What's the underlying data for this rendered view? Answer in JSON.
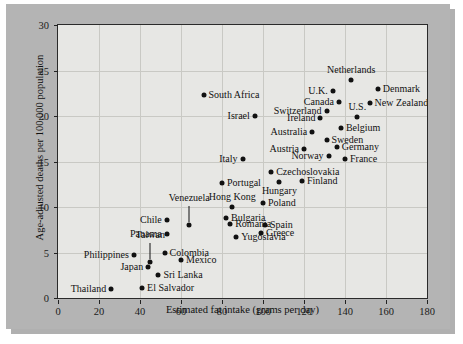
{
  "figure": {
    "background_color": "#ffffff",
    "mount_color": "#b4b4b4",
    "panel_color": "#e7e7e4",
    "axis_color": "#222222",
    "grid_color": "#c9c9c4",
    "point_color": "#111111"
  },
  "chart_data": {
    "type": "scatter",
    "title": "",
    "xlabel": "Estimated fat intake (grams per day)",
    "ylabel": "Age-adjusted deaths per 100,000 population",
    "xlim": [
      0,
      180
    ],
    "ylim": [
      0,
      30
    ],
    "xticks": [
      0,
      20,
      40,
      60,
      80,
      100,
      120,
      140,
      160,
      180
    ],
    "yticks": [
      0,
      5,
      10,
      15,
      20,
      25,
      30
    ],
    "grid": true,
    "legend": "none",
    "points": [
      {
        "label": "South Africa",
        "x": 71,
        "y": 22.3,
        "label_pos": "right",
        "leader": false
      },
      {
        "label": "Israel",
        "x": 96,
        "y": 20.0,
        "label_pos": "left",
        "leader": false
      },
      {
        "label": "Netherlands",
        "x": 143,
        "y": 24.0,
        "label_pos": "above",
        "leader": false
      },
      {
        "label": "Denmark",
        "x": 156,
        "y": 23.0,
        "label_pos": "right",
        "leader": false
      },
      {
        "label": "U.K.",
        "x": 134,
        "y": 22.8,
        "label_pos": "left",
        "leader": false
      },
      {
        "label": "Canada",
        "x": 137,
        "y": 21.5,
        "label_pos": "left",
        "leader": false
      },
      {
        "label": "New Zealand",
        "x": 152,
        "y": 21.4,
        "label_pos": "right",
        "leader": false
      },
      {
        "label": "Switzerland",
        "x": 131,
        "y": 20.6,
        "label_pos": "left",
        "leader": false
      },
      {
        "label": "U.S.",
        "x": 146,
        "y": 19.9,
        "label_pos": "above",
        "leader": false
      },
      {
        "label": "Ireland",
        "x": 128,
        "y": 19.8,
        "label_pos": "left",
        "leader": false
      },
      {
        "label": "Belgium",
        "x": 138,
        "y": 18.7,
        "label_pos": "right",
        "leader": false
      },
      {
        "label": "Australia",
        "x": 124,
        "y": 18.2,
        "label_pos": "left",
        "leader": false
      },
      {
        "label": "Sweden",
        "x": 131,
        "y": 17.4,
        "label_pos": "right",
        "leader": false
      },
      {
        "label": "Germany",
        "x": 136,
        "y": 16.6,
        "label_pos": "right",
        "leader": false
      },
      {
        "label": "Austria",
        "x": 120,
        "y": 16.4,
        "label_pos": "left",
        "leader": false
      },
      {
        "label": "Norway",
        "x": 132,
        "y": 15.6,
        "label_pos": "left",
        "leader": false
      },
      {
        "label": "France",
        "x": 140,
        "y": 15.3,
        "label_pos": "right",
        "leader": false
      },
      {
        "label": "Italy",
        "x": 90,
        "y": 15.3,
        "label_pos": "left",
        "leader": false
      },
      {
        "label": "Czechoslovakia",
        "x": 104,
        "y": 13.8,
        "label_pos": "right",
        "leader": false
      },
      {
        "label": "Finland",
        "x": 119,
        "y": 12.9,
        "label_pos": "right",
        "leader": false
      },
      {
        "label": "Hungary",
        "x": 108,
        "y": 12.8,
        "label_pos": "below",
        "leader": false
      },
      {
        "label": "Portugal",
        "x": 80,
        "y": 12.6,
        "label_pos": "right",
        "leader": false
      },
      {
        "label": "Poland",
        "x": 100,
        "y": 10.4,
        "label_pos": "right",
        "leader": false
      },
      {
        "label": "Hong Kong",
        "x": 85,
        "y": 10.0,
        "label_pos": "above",
        "leader": false
      },
      {
        "label": "Venezuela",
        "x": 64,
        "y": 8.0,
        "label_pos": "above",
        "leader": true
      },
      {
        "label": "Bulgaria",
        "x": 82,
        "y": 8.8,
        "label_pos": "right",
        "leader": false
      },
      {
        "label": "Chile",
        "x": 53,
        "y": 8.6,
        "label_pos": "left",
        "leader": false
      },
      {
        "label": "Romania",
        "x": 84,
        "y": 8.1,
        "label_pos": "right",
        "leader": false
      },
      {
        "label": "Spain",
        "x": 101,
        "y": 8.0,
        "label_pos": "right",
        "leader": false
      },
      {
        "label": "Greece",
        "x": 99,
        "y": 7.1,
        "label_pos": "right",
        "leader": false
      },
      {
        "label": "Panama",
        "x": 53,
        "y": 7.0,
        "label_pos": "left",
        "leader": false
      },
      {
        "label": "Yugoslavia",
        "x": 87,
        "y": 6.7,
        "label_pos": "right",
        "leader": false
      },
      {
        "label": "Taiwan",
        "x": 45,
        "y": 4.0,
        "label_pos": "above",
        "leader": true
      },
      {
        "label": "Colombia",
        "x": 52,
        "y": 4.9,
        "label_pos": "right",
        "leader": false
      },
      {
        "label": "Philippines",
        "x": 37,
        "y": 4.7,
        "label_pos": "left",
        "leader": false
      },
      {
        "label": "Mexico",
        "x": 60,
        "y": 4.2,
        "label_pos": "right",
        "leader": false
      },
      {
        "label": "Japan",
        "x": 44,
        "y": 3.4,
        "label_pos": "left",
        "leader": false
      },
      {
        "label": "Sri Lanka",
        "x": 49,
        "y": 2.5,
        "label_pos": "right",
        "leader": false
      },
      {
        "label": "El Salvador",
        "x": 41,
        "y": 1.1,
        "label_pos": "right",
        "leader": false
      },
      {
        "label": "Thailand",
        "x": 26,
        "y": 1.0,
        "label_pos": "left",
        "leader": false
      }
    ]
  }
}
